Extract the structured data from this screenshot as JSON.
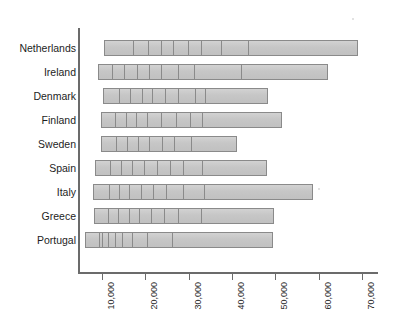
{
  "chart_data": {
    "type": "bar",
    "orientation": "horizontal",
    "title": "",
    "subtitle": "",
    "xlabel": "",
    "ylabel": "",
    "grid": false,
    "legend": null,
    "axis_pixel_origin_value": 4600,
    "xlim": [
      4600,
      73000
    ],
    "xticks": [
      10000,
      20000,
      30000,
      40000,
      50000,
      60000,
      70000
    ],
    "xtick_labels": [
      "10,000",
      "20,000",
      "30,000",
      "40,000",
      "50,000",
      "60,000",
      "70,000"
    ],
    "categories": [
      "Netherlands",
      "Ireland",
      "Denmark",
      "Finland",
      "Sweden",
      "Spain",
      "Italy",
      "Greece",
      "Portugal"
    ],
    "values": [
      69100,
      62200,
      48300,
      51500,
      41200,
      48100,
      58700,
      49700,
      49500
    ],
    "bar_start_values": [
      10500,
      9100,
      10200,
      9800,
      9800,
      8400,
      7900,
      8200,
      6100
    ],
    "series": [
      {
        "name": "Range",
        "categories": [
          "Netherlands",
          "Ireland",
          "Denmark",
          "Finland",
          "Sweden",
          "Spain",
          "Italy",
          "Greece",
          "Portugal"
        ],
        "start": [
          10500,
          9100,
          10200,
          9800,
          9800,
          8400,
          7900,
          8200,
          6100
        ],
        "end": [
          69100,
          62200,
          48300,
          51500,
          41200,
          48100,
          58700,
          49700,
          49500
        ]
      }
    ],
    "segment_boundaries": {
      "Netherlands": [
        17000,
        20400,
        23400,
        26200,
        29600,
        32600,
        37300,
        43500
      ],
      "Ireland": [
        12000,
        14800,
        17900,
        20600,
        23400,
        27400,
        31000,
        41800
      ],
      "Denmark": [
        13800,
        16300,
        18900,
        21400,
        24400,
        27400,
        31200,
        33600
      ],
      "Finland": [
        12700,
        15200,
        17600,
        20200,
        23400,
        26900,
        30000,
        32900
      ],
      "Sweden": [
        12900,
        15600,
        18000,
        20600,
        23600,
        26400,
        30300
      ],
      "Spain": [
        11600,
        14200,
        16700,
        19400,
        22400,
        25400,
        28500,
        32800
      ],
      "Italy": [
        11400,
        13700,
        16000,
        18800,
        21600,
        24600,
        28500,
        33400
      ],
      "Greece": [
        11200,
        13400,
        15900,
        18400,
        21200,
        24000,
        27400,
        32600
      ],
      "Portugal": [
        9000,
        9700,
        11100,
        12700,
        14300,
        16600,
        20100,
        25900
      ]
    }
  },
  "style": {
    "bar_fill": "#c9c9c9",
    "bar_border": "#8a8a8a",
    "axis_color": "#6b6b6b",
    "label_color": "#1d1d1d",
    "background": "#ffffff"
  }
}
